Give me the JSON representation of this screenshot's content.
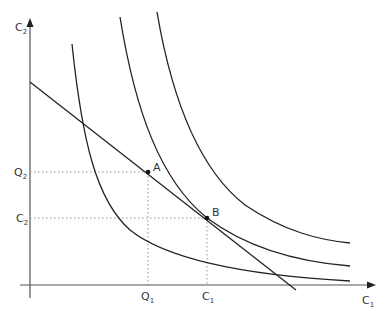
{
  "axes": {
    "y_label": "C",
    "y_label_sub": "2",
    "x_label": "C",
    "x_label_sub": "1"
  },
  "points": {
    "A": {
      "label": "A"
    },
    "B": {
      "label": "B"
    }
  },
  "ticks": {
    "y": [
      {
        "main": "Q",
        "sub": "2"
      },
      {
        "main": "C",
        "sub": "2"
      }
    ],
    "x": [
      {
        "main": "Q",
        "sub": "1"
      },
      {
        "main": "C",
        "sub": "1"
      }
    ]
  },
  "elements": {
    "budget_line": "budget constraint",
    "indifference_curves": 3
  }
}
